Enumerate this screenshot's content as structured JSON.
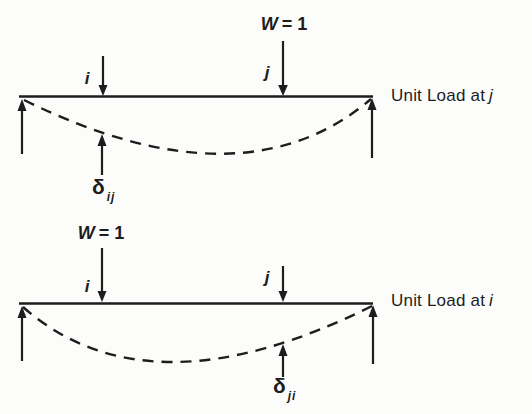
{
  "page": {
    "background": "#fcfcfb",
    "ink": "#1d1d1d"
  },
  "diagrams": {
    "top": {
      "load": {
        "symbol": "W",
        "equals_value": "= 1"
      },
      "point_i": "i",
      "point_j": "j",
      "caption": {
        "text": "Unit Load at",
        "point": "j"
      },
      "deflection": {
        "symbol": "δ",
        "subscript": "ij"
      }
    },
    "bottom": {
      "load": {
        "symbol": "W",
        "equals_value": "= 1"
      },
      "point_i": "i",
      "point_j": "j",
      "caption": {
        "text": "Unit Load at",
        "point": "i"
      },
      "deflection": {
        "symbol": "δ",
        "subscript": "ji"
      }
    }
  }
}
